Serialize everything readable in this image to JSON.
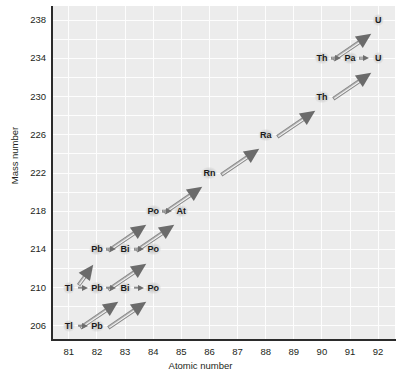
{
  "chart_data": {
    "type": "scatter",
    "title": "",
    "xlabel": "Atomic number",
    "ylabel": "Mass number",
    "xlim": [
      80.4,
      92.6
    ],
    "ylim": [
      204.5,
      239.5
    ],
    "xticks": [
      81,
      82,
      83,
      84,
      85,
      86,
      87,
      88,
      89,
      90,
      91,
      92
    ],
    "yticks": [
      206,
      210,
      214,
      218,
      222,
      226,
      230,
      234,
      238
    ],
    "grid": true,
    "legend": "none",
    "nuclides": [
      {
        "label": "U",
        "z": 92,
        "a": 238
      },
      {
        "label": "Th",
        "z": 90,
        "a": 234
      },
      {
        "label": "Pa",
        "z": 91,
        "a": 234
      },
      {
        "label": "U",
        "z": 92,
        "a": 234
      },
      {
        "label": "Th",
        "z": 90,
        "a": 230
      },
      {
        "label": "Ra",
        "z": 88,
        "a": 226
      },
      {
        "label": "Rn",
        "z": 86,
        "a": 222
      },
      {
        "label": "Po",
        "z": 84,
        "a": 218
      },
      {
        "label": "At",
        "z": 85,
        "a": 218
      },
      {
        "label": "Pb",
        "z": 82,
        "a": 214
      },
      {
        "label": "Bi",
        "z": 83,
        "a": 214
      },
      {
        "label": "Po",
        "z": 84,
        "a": 214
      },
      {
        "label": "Tl",
        "z": 81,
        "a": 210
      },
      {
        "label": "Pb",
        "z": 82,
        "a": 210
      },
      {
        "label": "Bi",
        "z": 83,
        "a": 210
      },
      {
        "label": "Po",
        "z": 84,
        "a": 210
      },
      {
        "label": "Tl",
        "z": 81,
        "a": 206
      },
      {
        "label": "Pb",
        "z": 82,
        "a": 206
      }
    ],
    "alpha_decays": [
      {
        "from_z": 92,
        "from_a": 238,
        "to_z": 90,
        "to_a": 234
      },
      {
        "from_z": 92,
        "from_a": 234,
        "to_z": 90,
        "to_a": 230
      },
      {
        "from_z": 90,
        "from_a": 230,
        "to_z": 88,
        "to_a": 226
      },
      {
        "from_z": 88,
        "from_a": 226,
        "to_z": 86,
        "to_a": 222
      },
      {
        "from_z": 86,
        "from_a": 222,
        "to_z": 84,
        "to_a": 218
      },
      {
        "from_z": 84,
        "from_a": 218,
        "to_z": 82,
        "to_a": 214
      },
      {
        "from_z": 85,
        "from_a": 218,
        "to_z": 83,
        "to_a": 214
      },
      {
        "from_z": 82,
        "from_a": 214,
        "to_z": 81,
        "to_a": 210
      },
      {
        "from_z": 84,
        "from_a": 214,
        "to_z": 82,
        "to_a": 210
      },
      {
        "from_z": 83,
        "from_a": 210,
        "to_z": 81,
        "to_a": 206
      },
      {
        "from_z": 84,
        "from_a": 210,
        "to_z": 82,
        "to_a": 206
      }
    ],
    "beta_decays": [
      {
        "from_z": 90,
        "from_a": 234,
        "to_z": 91,
        "to_a": 234
      },
      {
        "from_z": 91,
        "from_a": 234,
        "to_z": 92,
        "to_a": 234
      },
      {
        "from_z": 84,
        "from_a": 218,
        "to_z": 85,
        "to_a": 218
      },
      {
        "from_z": 82,
        "from_a": 214,
        "to_z": 83,
        "to_a": 214
      },
      {
        "from_z": 83,
        "from_a": 214,
        "to_z": 84,
        "to_a": 214
      },
      {
        "from_z": 81,
        "from_a": 210,
        "to_z": 82,
        "to_a": 210
      },
      {
        "from_z": 82,
        "from_a": 210,
        "to_z": 83,
        "to_a": 210
      },
      {
        "from_z": 83,
        "from_a": 210,
        "to_z": 84,
        "to_a": 210
      },
      {
        "from_z": 81,
        "from_a": 206,
        "to_z": 82,
        "to_a": 206
      }
    ],
    "colors": {
      "plot_background": "#ececec",
      "gridline": "#fdfdfd",
      "axis": "#2b2b2b",
      "text": "#231f20",
      "arrowhead": "#6b6b6b",
      "arrow_shaft_light": "#ffffff",
      "arrow_shaft_dark": "#9b9b9b"
    }
  }
}
